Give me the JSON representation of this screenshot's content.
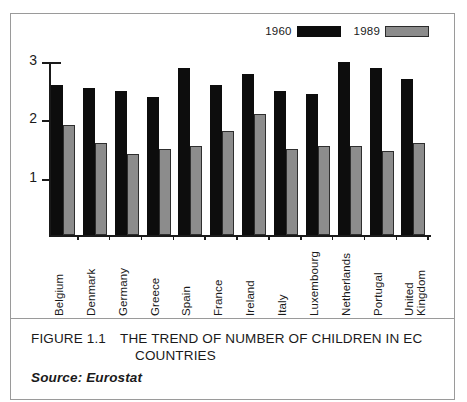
{
  "figure": {
    "caption_number": "FIGURE 1.1",
    "caption_title": "THE TREND OF NUMBER OF CHILDREN IN EC COUNTRIES",
    "source": "Source: Eurostat"
  },
  "legend": {
    "entries": [
      {
        "label": "1960",
        "swatch": "black-swatch",
        "color": "#0d0d0d"
      },
      {
        "label": "1989",
        "swatch": "gray-swatch",
        "color": "#8c8c8c"
      }
    ]
  },
  "axis": {
    "y_ticks": [
      "1",
      "2",
      "3"
    ]
  },
  "chart_data": {
    "type": "bar",
    "title": "THE TREND OF NUMBER OF CHILDREN IN EC COUNTRIES",
    "xlabel": "",
    "ylabel": "",
    "ylim": [
      0,
      3
    ],
    "yticks": [
      1,
      2,
      3
    ],
    "grid": false,
    "legend_position": "top-right",
    "categories": [
      "Belgium",
      "Denmark",
      "Germany",
      "Greece",
      "Spain",
      "France",
      "Ireland",
      "Italy",
      "Luxembourg",
      "Netherlands",
      "Portugal",
      "United Kingdom"
    ],
    "series": [
      {
        "name": "1960",
        "color": "#0d0d0d",
        "values": [
          2.6,
          2.55,
          2.5,
          2.4,
          2.9,
          2.6,
          2.8,
          2.5,
          2.45,
          3.0,
          2.9,
          2.7
        ]
      },
      {
        "name": "1989",
        "color": "#8c8c8c",
        "values": [
          1.9,
          1.6,
          1.4,
          1.5,
          1.55,
          1.8,
          2.1,
          1.5,
          1.55,
          1.55,
          1.45,
          1.6
        ]
      }
    ],
    "annotations": [
      "Source: Eurostat"
    ]
  }
}
